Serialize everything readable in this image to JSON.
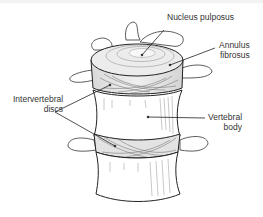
{
  "diagram": {
    "colors": {
      "line": "#222222",
      "label_text": "#333333",
      "disc_fill": "#e6e6e6",
      "bone_fill": "#ffffff"
    },
    "labels": {
      "nucleus_pulposus": {
        "text": "Nucleus pulposus"
      },
      "annulus_fibrosus": {
        "line1": "Annulus",
        "line2": "fibrosus"
      },
      "intervertebral_discs": {
        "line1": "Intervertebral",
        "line2": "discs"
      },
      "vertebral_body": {
        "line1": "Vertebral",
        "line2": "body"
      }
    }
  }
}
